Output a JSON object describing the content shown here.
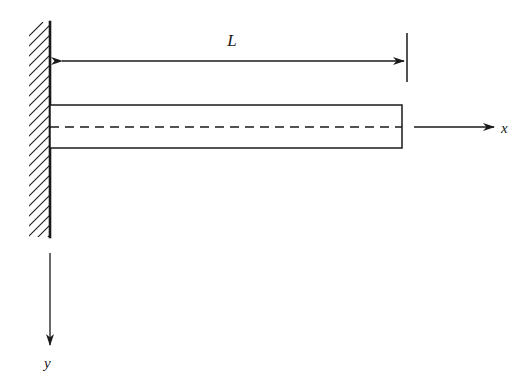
{
  "figure": {
    "kind": "engineering-diagram",
    "background_color": "#ffffff",
    "line_color": "#1a1a1a"
  },
  "labels": {
    "length_dimension": "L",
    "x_axis": "x",
    "y_axis": "y"
  },
  "geometry": {
    "wall": {
      "face_x": 50,
      "hatch_left_x": 30,
      "top_y": 22,
      "bottom_y": 237,
      "hatch_spacing": 10
    },
    "beam": {
      "left_x": 50,
      "right_x": 402,
      "top_y": 105,
      "bottom_y": 148,
      "centerline_y": 127
    },
    "dimension_line": {
      "y": 61,
      "left_x": 62,
      "right_x": 404,
      "tick_x": 407,
      "tick_top_y": 33,
      "tick_bottom_y": 82,
      "label_x": 232,
      "label_y": 46
    },
    "x_axis_arrow": {
      "start_x": 414,
      "end_x": 494,
      "y": 127,
      "label_x": 501,
      "label_y": 132
    },
    "y_axis_arrow": {
      "x": 50,
      "start_y": 253,
      "end_y": 345,
      "label_x": 44,
      "label_y": 366
    }
  }
}
